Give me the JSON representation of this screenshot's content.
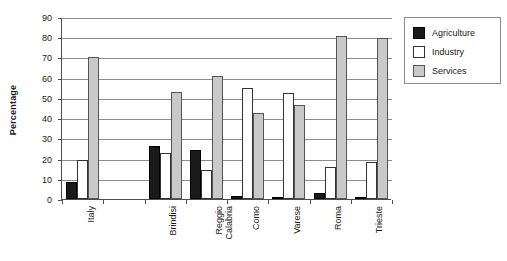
{
  "chart_data": {
    "type": "bar",
    "title": "",
    "subtitle": "",
    "xlabel": "",
    "ylabel": "Percentage",
    "ylim": [
      0,
      90
    ],
    "ytick_step": 10,
    "yticks": [
      0,
      10,
      20,
      30,
      40,
      50,
      60,
      70,
      80,
      90
    ],
    "ytick_labels": [
      "0",
      "10",
      "20",
      "30",
      "40",
      "50",
      "60",
      "70",
      "80",
      "90"
    ],
    "grid": true,
    "grid_axis": "y",
    "legend_position": "right",
    "categories": [
      "Italy",
      "",
      "Brindisi",
      "Reggio Calabria",
      "Como",
      "Varese",
      "Roma",
      "Trieste"
    ],
    "series": [
      {
        "name": "Agriculture",
        "color": "#1a1a1a",
        "values": [
          8.5,
          null,
          26,
          24,
          1.5,
          1,
          3,
          1
        ]
      },
      {
        "name": "Industry",
        "color": "#ffffff",
        "values": [
          19.5,
          null,
          23,
          14.5,
          55,
          52.5,
          16,
          18.5
        ]
      },
      {
        "name": "Services",
        "color": "#c9c9c9",
        "values": [
          70,
          null,
          53,
          61,
          42.5,
          46.5,
          80.5,
          79.5
        ]
      }
    ]
  },
  "legend": {
    "items": [
      {
        "label": "Agriculture",
        "swatch": "agriculture"
      },
      {
        "label": "Industry",
        "swatch": "industry"
      },
      {
        "label": "Services",
        "swatch": "services"
      }
    ]
  },
  "axis": {
    "y_title": "Percentage"
  }
}
